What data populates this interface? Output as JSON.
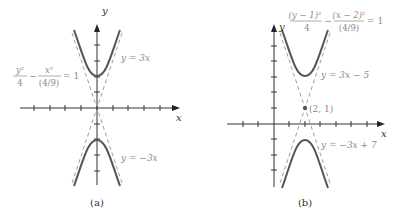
{
  "panels": [
    {
      "caption": "(a)",
      "x_axis_label": "x",
      "y_axis_label": "y",
      "equation": {
        "num1": "y²",
        "den1": "4",
        "minus": "−",
        "num2": "x²",
        "den2": "(4/9)",
        "rhs": "= 1"
      },
      "asymptote_upper_label": "y = 3x",
      "asymptote_lower_label": "y = −3x"
    },
    {
      "caption": "(b)",
      "x_axis_label": "x",
      "y_axis_label": "y",
      "equation": {
        "num1": "(y − 1)²",
        "den1": "4",
        "minus": "−",
        "num2": "(x − 2)²",
        "den2": "(4/9)",
        "rhs": "= 1"
      },
      "asymptote_upper_label": "y = 3x − 5",
      "asymptote_lower_label": "y = −3x + 7",
      "center_label": "(2, 1)"
    }
  ],
  "colors": {
    "curve": "#555555",
    "axis": "#333333",
    "asymptote": "#999999",
    "label": "#8a8a8a"
  }
}
